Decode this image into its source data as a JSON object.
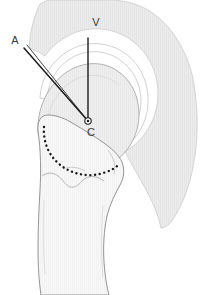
{
  "figure": {
    "background_color": "#ffffff"
  },
  "labels": {
    "apex": "A",
    "vertical": "V",
    "center": "C"
  },
  "colors": {
    "scapula_fill": "#e9e9e9",
    "scapula_stroke": "#c9c9c9",
    "bone_fill": "#f7f7f7",
    "bone_stroke": "#8d8d8d",
    "head_fill": "#eeeeee",
    "head_stroke": "#a8a8a8",
    "line_stroke": "#1d1d1d",
    "dotted_stroke": "#1d1d1d",
    "label_color": "#3a3a3a",
    "joint_space_fill": "#ffffff"
  },
  "geometry": {
    "center_point": {
      "x": 88,
      "y": 121
    },
    "vertical_line": {
      "x1": 88,
      "y1": 38,
      "x2": 88,
      "y2": 121
    },
    "angle_line": {
      "x1": 24,
      "y1": 48,
      "x2": 88,
      "y2": 121
    },
    "center_marker_radius": 3.2,
    "canvas": {
      "width": 200,
      "height": 295
    }
  },
  "structures": {
    "glenoid_fan": "acromion-scapula-fan",
    "humeral_head": "humeral-head-dome",
    "humeral_shaft": "proximal-humerus-shaft",
    "anatomical_neck": "anatomical-neck-dotted-line",
    "joint_space": "glenohumeral-joint-space"
  }
}
